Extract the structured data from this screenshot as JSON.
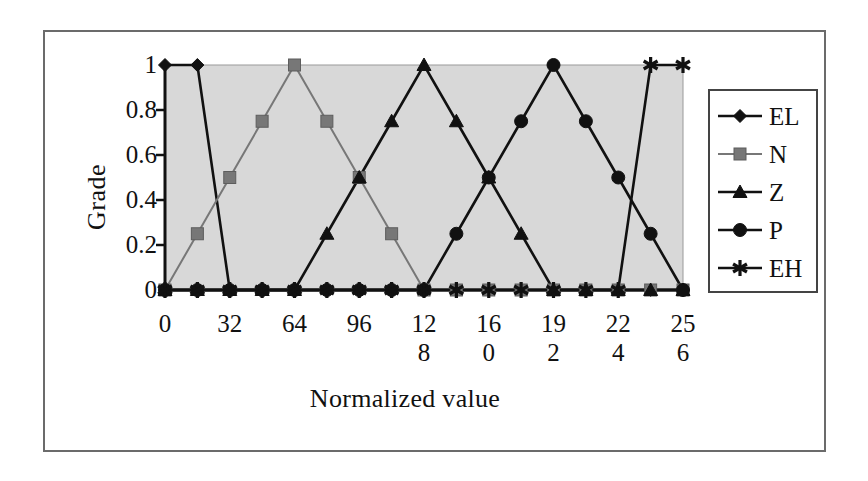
{
  "figure": {
    "background_color": "#ffffff",
    "frame_color": "#6b6b6b"
  },
  "axes": {
    "y_title": "Grade",
    "x_title": "Normalized value",
    "plot_background": "#d8d8d8",
    "y_ticks": [
      "0",
      "0.2",
      "0.4",
      "0.6",
      "0.8",
      "1"
    ],
    "x_ticks": [
      {
        "line1": "0",
        "line2": ""
      },
      {
        "line1": "32",
        "line2": ""
      },
      {
        "line1": "64",
        "line2": ""
      },
      {
        "line1": "96",
        "line2": ""
      },
      {
        "line1": "12",
        "line2": "8"
      },
      {
        "line1": "16",
        "line2": "0"
      },
      {
        "line1": "19",
        "line2": "2"
      },
      {
        "line1": "22",
        "line2": "4"
      },
      {
        "line1": "25",
        "line2": "6"
      }
    ]
  },
  "legend": {
    "position": "right",
    "items": [
      {
        "label": "EL",
        "marker": "diamond-marker",
        "color": "#111111"
      },
      {
        "label": "N",
        "marker": "square-marker",
        "color": "#777777"
      },
      {
        "label": "Z",
        "marker": "triangle-marker",
        "color": "#111111"
      },
      {
        "label": "P",
        "marker": "circle-marker",
        "color": "#111111"
      },
      {
        "label": "EH",
        "marker": "asterisk-marker",
        "color": "#111111"
      }
    ]
  },
  "chart_data": {
    "type": "line",
    "title": "",
    "xlabel": "Normalized value",
    "ylabel": "Grade",
    "xlim": [
      0,
      256
    ],
    "ylim": [
      0,
      1
    ],
    "grid": false,
    "legend_position": "right",
    "x": [
      0,
      16,
      32,
      48,
      64,
      80,
      96,
      112,
      128,
      144,
      160,
      176,
      192,
      208,
      224,
      240,
      256
    ],
    "series": [
      {
        "name": "EL",
        "marker": "diamond",
        "color": "#111111",
        "values": [
          1,
          1,
          0,
          0,
          0,
          0,
          0,
          0,
          0,
          0,
          0,
          0,
          0,
          0,
          0,
          0,
          0
        ]
      },
      {
        "name": "N",
        "marker": "square",
        "color": "#777777",
        "values": [
          0,
          0.25,
          0.5,
          0.75,
          1,
          0.75,
          0.5,
          0.25,
          0,
          0,
          0,
          0,
          0,
          0,
          0,
          0,
          0
        ]
      },
      {
        "name": "Z",
        "marker": "triangle",
        "color": "#111111",
        "values": [
          0,
          0,
          0,
          0,
          0,
          0.25,
          0.5,
          0.75,
          1,
          0.75,
          0.5,
          0.25,
          0,
          0,
          0,
          0,
          0
        ]
      },
      {
        "name": "P",
        "marker": "circle",
        "color": "#111111",
        "values": [
          0,
          0,
          0,
          0,
          0,
          0,
          0,
          0,
          0,
          0.25,
          0.5,
          0.75,
          1,
          0.75,
          0.5,
          0.25,
          0
        ]
      },
      {
        "name": "EH",
        "marker": "asterisk",
        "color": "#111111",
        "values": [
          0,
          0,
          0,
          0,
          0,
          0,
          0,
          0,
          0,
          0,
          0,
          0,
          0,
          0,
          0,
          1,
          1
        ]
      }
    ]
  }
}
